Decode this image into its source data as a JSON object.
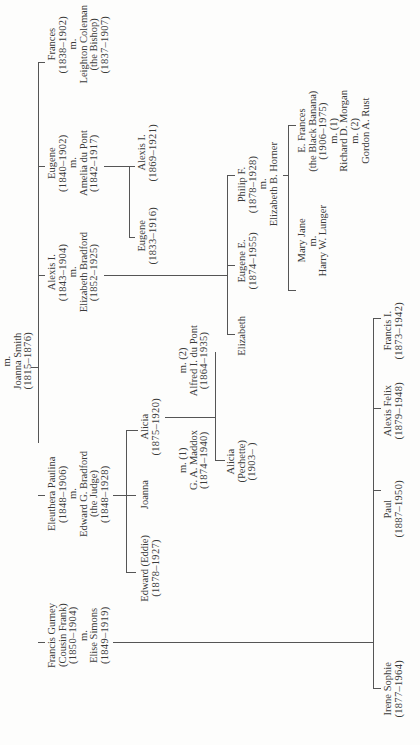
{
  "diagram": {
    "type": "family-tree",
    "orientation": "rotated-90-ccw",
    "root": {
      "lines": [
        "m.",
        "Joanna Smith",
        "(1815–1876)"
      ]
    },
    "generation1": [
      {
        "id": "frances",
        "lines": [
          "Frances",
          "(1838–1902)",
          "m.",
          "Leighton Coleman",
          "(the Bishop)",
          "(1837–1907)"
        ]
      },
      {
        "id": "eugene",
        "lines": [
          "Eugene",
          "(1840–1902)",
          "m.",
          "Amelia du Pont",
          "(1842–1917)"
        ]
      },
      {
        "id": "alexis",
        "lines": [
          "Alexis I.",
          "(1843–1904)",
          "m.",
          "Elizabeth Bradford",
          "(1852–1925)"
        ]
      },
      {
        "id": "eleuthera",
        "lines": [
          "Eleuthera Paulina",
          "(1848–1906)",
          "m.",
          "Edward G. Bradford",
          "(the Judge)",
          "(1848–1928)"
        ]
      },
      {
        "id": "francis-gurney",
        "lines": [
          "Francis Gurney",
          "(Cousin Frank)",
          "(1850–1904)",
          "m.",
          "Elise Simons",
          "(1849–1919)"
        ]
      }
    ],
    "generation2": {
      "eugene_children": [
        {
          "id": "alexis-i",
          "lines": [
            "Alexis I.",
            "(1869–1921)"
          ]
        },
        {
          "id": "eugene-jr",
          "lines": [
            "Eugene",
            "(1833–1916)"
          ]
        }
      ],
      "alexis_children": [
        {
          "id": "philip",
          "lines": [
            "Philip F.",
            "(1878–1928)",
            "m.",
            "Elizabeth B. Horner"
          ]
        },
        {
          "id": "eugene-e",
          "lines": [
            "Eugene E.",
            "(1874–1955)"
          ]
        },
        {
          "id": "elizabeth",
          "lines": [
            "Elizabeth"
          ]
        }
      ],
      "eleuthera_children": [
        {
          "id": "alicia",
          "lines": [
            "Alicia",
            "(1875–1920)"
          ]
        },
        {
          "id": "joanna",
          "lines": [
            "Joanna"
          ]
        },
        {
          "id": "edward",
          "lines": [
            "Edward (Eddie)",
            "(1878–1927)"
          ]
        }
      ],
      "alicia_spouses": [
        {
          "id": "alfred",
          "lines": [
            "m. (2)",
            "Alfred I. du Pont",
            "(1864–1935)"
          ]
        },
        {
          "id": "maddox",
          "lines": [
            "m. (1)",
            "G. A. Maddox",
            "(1874–1940)"
          ]
        }
      ],
      "francis_children": [
        {
          "id": "francis-i",
          "lines": [
            "Francis I.",
            "(1873–1942)"
          ]
        },
        {
          "id": "alexis-felix",
          "lines": [
            "Alexis Felix",
            "(1879–1948)"
          ]
        },
        {
          "id": "paul",
          "lines": [
            "Paul",
            "(1887–1950)"
          ]
        },
        {
          "id": "irene",
          "lines": [
            "Irene Sophie",
            "(1877–1964)"
          ]
        }
      ]
    },
    "generation3": {
      "philip_children": [
        {
          "id": "e-frances",
          "lines": [
            "E. Frances",
            "(the Black Banana)",
            "(1906–1975)",
            "m. (1)",
            "Richard D. Morgan",
            "m. (2)",
            "Gordon A. Rust"
          ]
        },
        {
          "id": "mary-jane",
          "lines": [
            "Mary Jane",
            "m.",
            "Harry W. Lunger"
          ]
        }
      ],
      "alicia_children": [
        {
          "id": "alicia-pechette",
          "lines": [
            "Alicia",
            "(Pechette)",
            "(1903–        )"
          ]
        }
      ]
    }
  }
}
